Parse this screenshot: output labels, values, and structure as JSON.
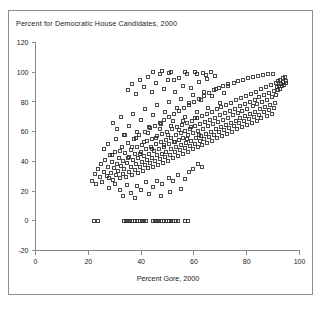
{
  "figure": {
    "title": "Percent for Democratic House Candidates, 2000",
    "background_color": "#ffffff",
    "frame_color": "#8c8c8c",
    "axis_color": "#8a8a8a",
    "marker_color": "#2a2a2a",
    "text_color": "#1a1a1a"
  },
  "chart_data": {
    "type": "scatter",
    "title": "Percent for Democratic House Candidates, 2000",
    "xlabel": "Percent Gore, 2000",
    "ylabel": "",
    "xlim": [
      0,
      100
    ],
    "ylim": [
      -20,
      120
    ],
    "xticks": [
      0,
      20,
      40,
      60,
      80,
      100
    ],
    "yticks": [
      -20,
      0,
      20,
      40,
      60,
      80,
      100,
      120
    ],
    "xtick_labels": [
      "0",
      "20",
      "40",
      "60",
      "80",
      "100"
    ],
    "ytick_labels": [
      "-20",
      "0",
      "20",
      "40",
      "60",
      "80",
      "100",
      "120"
    ],
    "grid": false,
    "legend": null,
    "marker": "open-square",
    "marker_size_px": 3,
    "n_points": 404,
    "points": [
      [
        21.5,
        27.0
      ],
      [
        22.4,
        31.2
      ],
      [
        23.1,
        24.5
      ],
      [
        23.8,
        35.0
      ],
      [
        24.3,
        29.4
      ],
      [
        24.9,
        38.5
      ],
      [
        25.2,
        26.0
      ],
      [
        25.8,
        33.1
      ],
      [
        26.4,
        41.0
      ],
      [
        26.9,
        30.2
      ],
      [
        27.3,
        36.4
      ],
      [
        27.8,
        28.6
      ],
      [
        28.2,
        44.0
      ],
      [
        28.6,
        32.0
      ],
      [
        29.0,
        39.5
      ],
      [
        29.4,
        27.5
      ],
      [
        29.8,
        35.8
      ],
      [
        30.1,
        46.2
      ],
      [
        30.5,
        30.8
      ],
      [
        30.9,
        38.0
      ],
      [
        31.2,
        33.4
      ],
      [
        31.6,
        42.5
      ],
      [
        31.9,
        28.9
      ],
      [
        32.3,
        36.6
      ],
      [
        32.6,
        50.0
      ],
      [
        33.0,
        31.5
      ],
      [
        33.3,
        40.2
      ],
      [
        33.7,
        34.8
      ],
      [
        34.0,
        45.5
      ],
      [
        34.3,
        29.8
      ],
      [
        34.7,
        38.8
      ],
      [
        35.0,
        52.4
      ],
      [
        35.3,
        33.0
      ],
      [
        35.6,
        43.0
      ],
      [
        36.0,
        36.2
      ],
      [
        36.3,
        47.8
      ],
      [
        36.6,
        31.0
      ],
      [
        36.9,
        40.6
      ],
      [
        37.2,
        55.0
      ],
      [
        37.5,
        34.5
      ],
      [
        37.8,
        44.8
      ],
      [
        38.1,
        38.0
      ],
      [
        38.4,
        49.5
      ],
      [
        38.7,
        32.2
      ],
      [
        39.0,
        42.0
      ],
      [
        39.3,
        57.5
      ],
      [
        39.6,
        36.0
      ],
      [
        39.9,
        46.5
      ],
      [
        40.2,
        39.8
      ],
      [
        40.5,
        51.0
      ],
      [
        40.8,
        33.8
      ],
      [
        41.0,
        43.5
      ],
      [
        41.3,
        60.0
      ],
      [
        41.6,
        37.4
      ],
      [
        41.9,
        48.0
      ],
      [
        42.1,
        41.2
      ],
      [
        42.4,
        53.5
      ],
      [
        42.7,
        35.2
      ],
      [
        43.0,
        45.0
      ],
      [
        43.2,
        62.5
      ],
      [
        43.5,
        38.8
      ],
      [
        43.8,
        49.8
      ],
      [
        44.0,
        42.5
      ],
      [
        44.3,
        55.0
      ],
      [
        44.6,
        36.5
      ],
      [
        44.8,
        46.8
      ],
      [
        45.1,
        64.0
      ],
      [
        45.4,
        40.0
      ],
      [
        45.6,
        51.5
      ],
      [
        45.9,
        44.0
      ],
      [
        46.2,
        57.0
      ],
      [
        46.4,
        37.8
      ],
      [
        46.7,
        48.5
      ],
      [
        47.0,
        66.0
      ],
      [
        47.2,
        41.5
      ],
      [
        47.5,
        53.0
      ],
      [
        47.8,
        45.2
      ],
      [
        48.0,
        58.5
      ],
      [
        48.3,
        39.0
      ],
      [
        48.6,
        50.0
      ],
      [
        48.8,
        68.0
      ],
      [
        49.1,
        43.0
      ],
      [
        49.4,
        54.5
      ],
      [
        49.6,
        46.5
      ],
      [
        49.9,
        60.0
      ],
      [
        50.2,
        40.5
      ],
      [
        50.4,
        51.5
      ],
      [
        50.7,
        70.0
      ],
      [
        51.0,
        44.5
      ],
      [
        51.2,
        56.0
      ],
      [
        51.5,
        48.0
      ],
      [
        51.8,
        61.5
      ],
      [
        52.0,
        42.0
      ],
      [
        52.3,
        53.0
      ],
      [
        52.6,
        72.0
      ],
      [
        52.8,
        46.0
      ],
      [
        53.1,
        57.5
      ],
      [
        53.4,
        49.5
      ],
      [
        53.6,
        63.0
      ],
      [
        53.9,
        43.5
      ],
      [
        54.2,
        54.5
      ],
      [
        54.4,
        74.0
      ],
      [
        54.7,
        47.5
      ],
      [
        55.0,
        59.0
      ],
      [
        55.2,
        51.0
      ],
      [
        55.5,
        64.5
      ],
      [
        55.8,
        45.0
      ],
      [
        56.0,
        56.0
      ],
      [
        56.3,
        76.0
      ],
      [
        56.6,
        49.0
      ],
      [
        56.8,
        60.5
      ],
      [
        57.1,
        52.5
      ],
      [
        57.4,
        66.0
      ],
      [
        57.6,
        46.5
      ],
      [
        57.9,
        57.5
      ],
      [
        58.2,
        78.0
      ],
      [
        58.4,
        50.5
      ],
      [
        58.7,
        62.0
      ],
      [
        59.0,
        54.0
      ],
      [
        59.2,
        67.5
      ],
      [
        59.5,
        48.0
      ],
      [
        59.8,
        59.0
      ],
      [
        60.0,
        80.0
      ],
      [
        60.3,
        52.0
      ],
      [
        60.6,
        63.5
      ],
      [
        60.8,
        55.5
      ],
      [
        61.1,
        69.0
      ],
      [
        61.4,
        49.5
      ],
      [
        61.6,
        60.5
      ],
      [
        61.9,
        82.0
      ],
      [
        62.2,
        53.5
      ],
      [
        62.4,
        65.0
      ],
      [
        62.7,
        57.0
      ],
      [
        63.0,
        70.5
      ],
      [
        63.2,
        51.0
      ],
      [
        63.5,
        62.0
      ],
      [
        63.8,
        84.0
      ],
      [
        64.0,
        55.0
      ],
      [
        64.3,
        66.5
      ],
      [
        64.6,
        58.5
      ],
      [
        64.8,
        72.0
      ],
      [
        65.1,
        52.5
      ],
      [
        65.4,
        63.5
      ],
      [
        65.6,
        86.0
      ],
      [
        65.9,
        56.5
      ],
      [
        66.2,
        68.0
      ],
      [
        66.4,
        60.0
      ],
      [
        66.7,
        73.5
      ],
      [
        67.0,
        54.0
      ],
      [
        67.2,
        65.0
      ],
      [
        67.5,
        88.0
      ],
      [
        67.8,
        58.0
      ],
      [
        68.0,
        69.5
      ],
      [
        68.3,
        61.5
      ],
      [
        68.6,
        75.0
      ],
      [
        68.8,
        55.5
      ],
      [
        69.1,
        66.5
      ],
      [
        69.4,
        89.5
      ],
      [
        69.6,
        59.5
      ],
      [
        69.9,
        71.0
      ],
      [
        70.2,
        63.0
      ],
      [
        70.4,
        76.5
      ],
      [
        70.7,
        57.0
      ],
      [
        71.0,
        68.0
      ],
      [
        71.2,
        91.0
      ],
      [
        71.5,
        61.0
      ],
      [
        71.8,
        72.5
      ],
      [
        72.0,
        64.5
      ],
      [
        72.3,
        78.0
      ],
      [
        72.6,
        58.5
      ],
      [
        72.8,
        69.5
      ],
      [
        73.1,
        92.0
      ],
      [
        73.4,
        62.5
      ],
      [
        73.6,
        74.0
      ],
      [
        73.9,
        66.0
      ],
      [
        74.2,
        79.5
      ],
      [
        74.4,
        60.0
      ],
      [
        74.7,
        71.0
      ],
      [
        75.0,
        93.0
      ],
      [
        75.2,
        64.0
      ],
      [
        75.5,
        75.5
      ],
      [
        75.8,
        67.5
      ],
      [
        76.0,
        81.0
      ],
      [
        76.3,
        61.5
      ],
      [
        76.6,
        72.5
      ],
      [
        76.8,
        94.0
      ],
      [
        77.1,
        65.5
      ],
      [
        77.4,
        77.0
      ],
      [
        77.6,
        69.0
      ],
      [
        77.9,
        82.5
      ],
      [
        78.2,
        63.0
      ],
      [
        78.4,
        74.0
      ],
      [
        78.7,
        95.0
      ],
      [
        79.0,
        67.0
      ],
      [
        79.2,
        78.5
      ],
      [
        79.5,
        70.5
      ],
      [
        79.8,
        84.0
      ],
      [
        80.0,
        64.5
      ],
      [
        80.3,
        75.5
      ],
      [
        80.6,
        96.0
      ],
      [
        80.8,
        68.5
      ],
      [
        81.1,
        80.0
      ],
      [
        81.4,
        72.0
      ],
      [
        81.6,
        85.5
      ],
      [
        81.9,
        66.0
      ],
      [
        82.2,
        77.0
      ],
      [
        82.4,
        97.0
      ],
      [
        82.7,
        70.0
      ],
      [
        83.0,
        81.5
      ],
      [
        83.2,
        73.5
      ],
      [
        83.5,
        87.0
      ],
      [
        83.8,
        67.5
      ],
      [
        84.0,
        78.5
      ],
      [
        84.3,
        97.5
      ],
      [
        84.6,
        71.5
      ],
      [
        84.8,
        83.0
      ],
      [
        85.1,
        75.0
      ],
      [
        85.4,
        88.5
      ],
      [
        85.6,
        69.0
      ],
      [
        85.9,
        80.0
      ],
      [
        86.2,
        98.0
      ],
      [
        86.4,
        73.0
      ],
      [
        86.7,
        84.5
      ],
      [
        87.0,
        76.5
      ],
      [
        87.2,
        90.0
      ],
      [
        87.5,
        70.5
      ],
      [
        87.8,
        81.5
      ],
      [
        88.0,
        98.5
      ],
      [
        88.3,
        74.5
      ],
      [
        88.6,
        86.0
      ],
      [
        88.8,
        78.0
      ],
      [
        89.1,
        91.5
      ],
      [
        89.4,
        72.0
      ],
      [
        89.6,
        83.0
      ],
      [
        89.9,
        99.0
      ],
      [
        90.2,
        76.0
      ],
      [
        90.4,
        87.5
      ],
      [
        90.7,
        79.5
      ],
      [
        91.0,
        93.0
      ],
      [
        91.2,
        85.0
      ],
      [
        91.5,
        90.0
      ],
      [
        91.8,
        88.0
      ],
      [
        92.0,
        94.0
      ],
      [
        92.3,
        91.0
      ],
      [
        92.6,
        89.0
      ],
      [
        92.8,
        95.0
      ],
      [
        93.1,
        92.0
      ],
      [
        93.4,
        90.5
      ],
      [
        93.6,
        96.0
      ],
      [
        93.9,
        93.5
      ],
      [
        94.2,
        91.5
      ],
      [
        94.4,
        97.0
      ],
      [
        94.7,
        94.0
      ],
      [
        95.0,
        92.5
      ],
      [
        35.0,
        88.0
      ],
      [
        36.5,
        92.0
      ],
      [
        38.0,
        85.5
      ],
      [
        39.5,
        95.0
      ],
      [
        41.0,
        90.0
      ],
      [
        42.5,
        97.0
      ],
      [
        44.0,
        86.5
      ],
      [
        45.5,
        93.0
      ],
      [
        47.0,
        99.0
      ],
      [
        48.5,
        88.5
      ],
      [
        50.0,
        94.5
      ],
      [
        51.5,
        100.0
      ],
      [
        53.0,
        87.0
      ],
      [
        54.5,
        96.0
      ],
      [
        56.0,
        91.0
      ],
      [
        57.5,
        98.5
      ],
      [
        59.0,
        89.5
      ],
      [
        60.5,
        100.0
      ],
      [
        62.0,
        93.5
      ],
      [
        63.5,
        99.5
      ],
      [
        65.0,
        95.5
      ],
      [
        66.5,
        100.0
      ],
      [
        68.0,
        97.5
      ],
      [
        50.5,
        99.5
      ],
      [
        56.5,
        100.0
      ],
      [
        44.5,
        100.0
      ],
      [
        48.0,
        101.0
      ],
      [
        61.0,
        99.0
      ],
      [
        64.5,
        98.0
      ],
      [
        52.5,
        95.0
      ],
      [
        29.5,
        66.0
      ],
      [
        31.0,
        62.0
      ],
      [
        32.5,
        70.0
      ],
      [
        34.0,
        58.0
      ],
      [
        35.5,
        64.0
      ],
      [
        37.0,
        72.0
      ],
      [
        38.5,
        60.0
      ],
      [
        40.0,
        68.0
      ],
      [
        41.5,
        75.0
      ],
      [
        43.0,
        63.0
      ],
      [
        44.5,
        71.0
      ],
      [
        46.0,
        78.0
      ],
      [
        47.5,
        65.0
      ],
      [
        49.0,
        73.0
      ],
      [
        50.5,
        80.0
      ],
      [
        52.0,
        67.0
      ],
      [
        53.5,
        76.0
      ],
      [
        55.0,
        82.0
      ],
      [
        56.5,
        70.0
      ],
      [
        58.0,
        79.0
      ],
      [
        59.5,
        85.0
      ],
      [
        61.0,
        73.0
      ],
      [
        62.5,
        81.0
      ],
      [
        64.0,
        87.0
      ],
      [
        65.5,
        76.0
      ],
      [
        67.0,
        84.0
      ],
      [
        68.5,
        89.0
      ],
      [
        70.0,
        79.0
      ],
      [
        71.5,
        86.0
      ],
      [
        73.0,
        91.0
      ],
      [
        26.0,
        48.0
      ],
      [
        27.5,
        52.0
      ],
      [
        29.0,
        44.0
      ],
      [
        30.5,
        55.0
      ],
      [
        32.0,
        47.0
      ],
      [
        33.5,
        58.0
      ],
      [
        35.0,
        42.0
      ],
      [
        36.5,
        50.0
      ],
      [
        38.0,
        56.0
      ],
      [
        39.5,
        45.0
      ],
      [
        41.0,
        53.0
      ],
      [
        42.5,
        59.0
      ],
      [
        44.0,
        48.0
      ],
      [
        45.5,
        56.0
      ],
      [
        47.0,
        62.0
      ],
      [
        48.5,
        51.0
      ],
      [
        50.0,
        58.0
      ],
      [
        51.5,
        64.0
      ],
      [
        53.0,
        53.0
      ],
      [
        54.5,
        61.0
      ],
      [
        56.0,
        67.0
      ],
      [
        57.5,
        55.0
      ],
      [
        59.0,
        63.0
      ],
      [
        60.5,
        69.0
      ],
      [
        62.0,
        58.0
      ],
      [
        28.0,
        22.0
      ],
      [
        30.0,
        25.0
      ],
      [
        32.0,
        20.5
      ],
      [
        34.5,
        24.0
      ],
      [
        36.0,
        19.0
      ],
      [
        38.5,
        23.5
      ],
      [
        40.0,
        21.0
      ],
      [
        42.0,
        26.0
      ],
      [
        44.5,
        22.5
      ],
      [
        46.0,
        27.0
      ],
      [
        48.0,
        24.5
      ],
      [
        50.5,
        29.0
      ],
      [
        52.0,
        26.5
      ],
      [
        54.0,
        31.0
      ],
      [
        56.5,
        28.0
      ],
      [
        58.0,
        33.0
      ],
      [
        33.0,
        17.0
      ],
      [
        37.5,
        15.5
      ],
      [
        43.0,
        18.0
      ],
      [
        47.5,
        16.5
      ],
      [
        51.0,
        19.5
      ],
      [
        55.0,
        21.5
      ],
      [
        59.5,
        35.0
      ],
      [
        61.5,
        38.0
      ],
      [
        63.0,
        36.0
      ],
      [
        22.0,
        0.0
      ],
      [
        23.5,
        0.0
      ],
      [
        33.5,
        0.0
      ],
      [
        34.3,
        0.0
      ],
      [
        35.1,
        0.0
      ],
      [
        35.9,
        0.0
      ],
      [
        36.7,
        0.0
      ],
      [
        37.5,
        0.0
      ],
      [
        38.6,
        0.0
      ],
      [
        39.4,
        0.0
      ],
      [
        40.2,
        0.0
      ],
      [
        41.0,
        0.0
      ],
      [
        41.8,
        0.0
      ],
      [
        44.5,
        0.0
      ],
      [
        45.3,
        0.0
      ],
      [
        46.1,
        0.0
      ],
      [
        46.9,
        0.0
      ],
      [
        47.7,
        0.0
      ],
      [
        48.5,
        0.0
      ],
      [
        49.6,
        0.0
      ],
      [
        50.4,
        0.0
      ],
      [
        51.2,
        0.0
      ],
      [
        52.0,
        0.0
      ],
      [
        53.1,
        0.0
      ],
      [
        53.9,
        0.0
      ],
      [
        56.5,
        0.0
      ],
      [
        57.8,
        0.0
      ]
    ]
  }
}
